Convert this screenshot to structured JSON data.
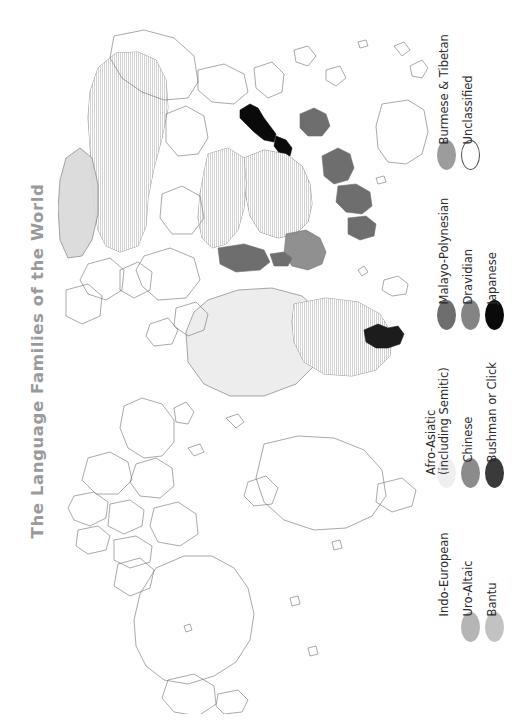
{
  "title": {
    "text": "The Language Families of the World",
    "color": "#9a9a9a",
    "rotation": "-90deg"
  },
  "map": {
    "name": "world-language-families-map",
    "orientation": "rotated-90-clockwise",
    "outline_color": "#6f6f6f",
    "background": "#ffffff"
  },
  "legend": {
    "groups": [
      {
        "name": "legend-column-1",
        "items": [
          {
            "label": "Burmese & Tibetan",
            "color": "#9c9c9c",
            "swatch": "filled-ellipse"
          },
          {
            "label": "Malayo-Polynesian",
            "color": "#6e6e6e",
            "swatch": "filled-ellipse"
          },
          {
            "label": "Afro-Asiatic\n(including Semitic)",
            "label_line1": "Afro-Asiatic",
            "label_line2": "(including Semitic)",
            "color": "#efefef",
            "swatch": "filled-ellipse"
          },
          {
            "label": "Indo-European",
            "color": "#ffffff",
            "swatch": "filled-ellipse"
          }
        ]
      },
      {
        "name": "legend-column-2",
        "items": [
          {
            "label": "Unclassified",
            "color": "#ffffff",
            "swatch": "outline-ellipse"
          },
          {
            "label": "Dravidian",
            "color": "#848484",
            "swatch": "filled-ellipse"
          },
          {
            "label": "Chinese",
            "color": "#8b8b8b",
            "swatch": "filled-ellipse"
          },
          {
            "label": "Uro-Altaic",
            "color": "#b5b5b5",
            "swatch": "filled-ellipse"
          }
        ]
      },
      {
        "name": "legend-column-3",
        "items": [
          {
            "label": "Japanese",
            "color": "#0a0a0a",
            "swatch": "filled-ellipse"
          },
          {
            "label": "Bushman or Click",
            "color": "#3a3a3a",
            "swatch": "filled-ellipse"
          },
          {
            "label": "Bantu",
            "color": "#c2c2c2",
            "swatch": "filled-ellipse"
          }
        ]
      }
    ],
    "entries_flat": [
      "Burmese & Tibetan",
      "Unclassified",
      "Malayo-Polynesian",
      "Dravidian",
      "Japanese",
      "Afro-Asiatic (including Semitic)",
      "Chinese",
      "Bushman or Click",
      "Indo-European",
      "Uro-Altaic",
      "Bantu"
    ]
  }
}
